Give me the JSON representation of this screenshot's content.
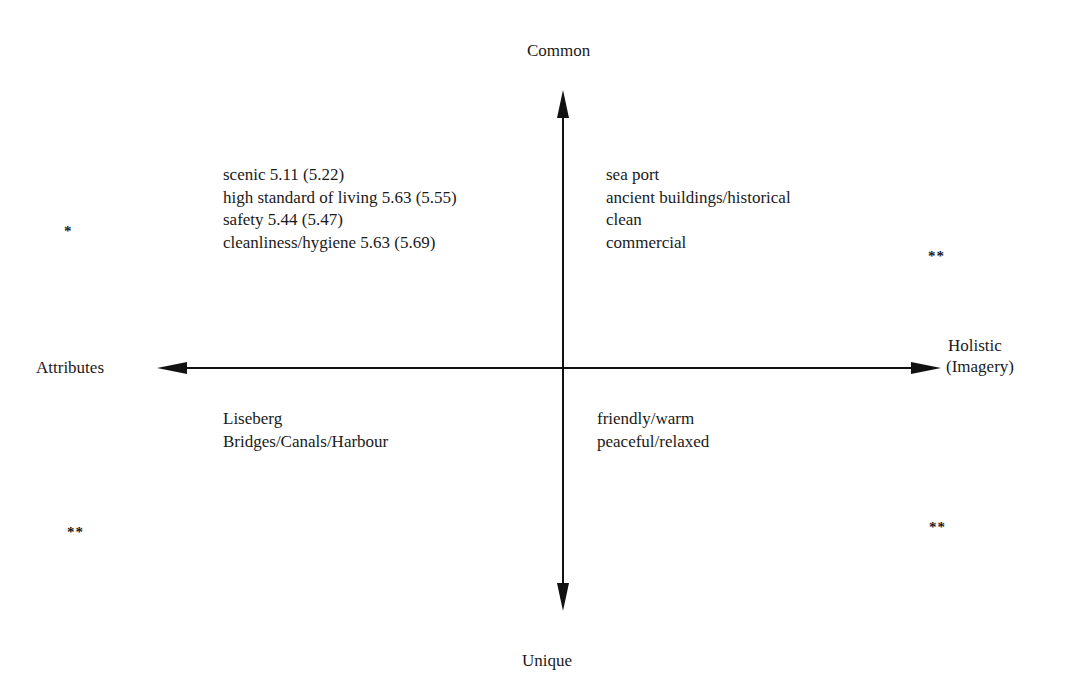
{
  "axes": {
    "top_label": "Common",
    "bottom_label": "Unique",
    "left_label": "Attributes",
    "right_label_lines": [
      "Holistic",
      "(Imagery)"
    ],
    "color": "#111111"
  },
  "quadrants": {
    "top_left": {
      "items": [
        "scenic 5.11 (5.22)",
        "high standard of living 5.63 (5.55)",
        "safety 5.44 (5.47)",
        "cleanliness/hygiene 5.63 (5.69)"
      ],
      "marker": "*"
    },
    "top_right": {
      "items": [
        "sea port",
        "ancient buildings/historical",
        "clean",
        "commercial"
      ],
      "marker": "**"
    },
    "bottom_left": {
      "items": [
        "Liseberg",
        "Bridges/Canals/Harbour"
      ],
      "marker": "**"
    },
    "bottom_right": {
      "items": [
        "friendly/warm",
        "peaceful/relaxed"
      ],
      "marker": "**"
    }
  }
}
